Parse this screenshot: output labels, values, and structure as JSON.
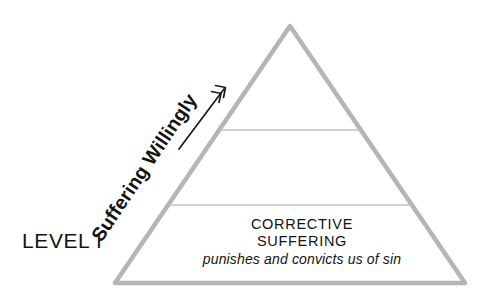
{
  "diagram": {
    "type": "pyramid",
    "background_color": "#ffffff",
    "outline_color": "#b5b5b5",
    "divider_color": "#bdbdbd",
    "text_color": "#131313",
    "level_label": "LEVEL I",
    "side_label": "Suffering Willingly",
    "band": {
      "title_line_1": "CORRECTIVE",
      "title_line_2": "SUFFERING",
      "subtitle": "punishes and convicts us of sin"
    },
    "arrow": {
      "name": "upward-arrow",
      "direction": "up-right"
    },
    "geometry": {
      "apex": [
        290,
        26
      ],
      "base_left": [
        115,
        283
      ],
      "base_right": [
        465,
        283
      ],
      "divider_upper_y": 130,
      "divider_lower_y": 205
    }
  }
}
